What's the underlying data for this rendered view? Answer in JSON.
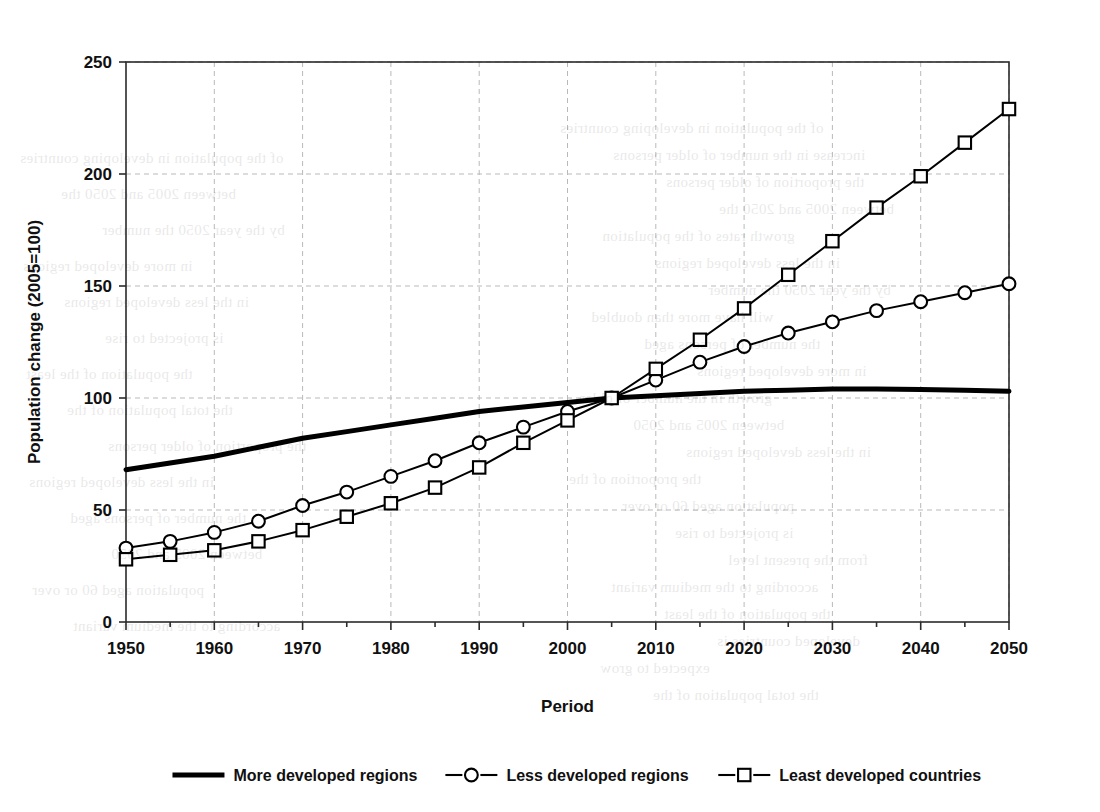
{
  "chart_data": {
    "type": "line",
    "title": "",
    "xlabel": "Period",
    "ylabel": "Population change (2005=100)",
    "xlim": [
      1950,
      2050
    ],
    "ylim": [
      0,
      250
    ],
    "ytick_values": [
      0,
      50,
      100,
      150,
      200,
      250
    ],
    "ytick_labels": [
      "0",
      "50",
      "100",
      "150",
      "200",
      "250"
    ],
    "xtick_values": [
      1950,
      1960,
      1970,
      1980,
      1990,
      2000,
      2010,
      2020,
      2030,
      2040,
      2050
    ],
    "xtick_labels": [
      "1950",
      "1960",
      "1970",
      "1980",
      "1990",
      "2000",
      "2010",
      "2020",
      "2030",
      "2040",
      "2050"
    ],
    "x_minor_interval": 5,
    "grid": "major-vertical-and-horizontal-dotted",
    "legend_position": "bottom",
    "x": [
      1950,
      1955,
      1960,
      1965,
      1970,
      1975,
      1980,
      1985,
      1990,
      1995,
      2000,
      2005,
      2010,
      2015,
      2020,
      2025,
      2030,
      2035,
      2040,
      2045,
      2050
    ],
    "series": [
      {
        "name": "More developed regions",
        "marker": "none",
        "line_width": 5,
        "color": "#000000",
        "values": [
          68,
          71,
          74,
          78,
          82,
          85,
          88,
          91,
          94,
          96,
          98,
          100,
          101,
          102,
          103,
          103.5,
          104,
          104,
          103.8,
          103.5,
          103
        ]
      },
      {
        "name": "Less developed regions",
        "marker": "circle",
        "line_width": 2,
        "color": "#000000",
        "values": [
          33,
          36,
          40,
          45,
          52,
          58,
          65,
          72,
          80,
          87,
          94,
          100,
          108,
          116,
          123,
          129,
          134,
          139,
          143,
          147,
          151
        ]
      },
      {
        "name": "Least developed countries",
        "marker": "square",
        "line_width": 2,
        "color": "#000000",
        "values": [
          28,
          30,
          32,
          36,
          41,
          47,
          53,
          60,
          69,
          80,
          90,
          100,
          113,
          126,
          140,
          155,
          170,
          185,
          199,
          214,
          229
        ]
      }
    ]
  },
  "legend": {
    "items": [
      {
        "label": "More developed regions",
        "marker": "none"
      },
      {
        "label": "Less developed regions",
        "marker": "circle"
      },
      {
        "label": "Least developed countries",
        "marker": "square"
      }
    ]
  },
  "background_text": {
    "lines": [
      "of the population in developing countries",
      "increase in the number of older persons",
      "the proportion of older persons",
      "between 2005 and 2050 the",
      "growth rates of the population",
      "in the less developed regions",
      "by the year 2050 the number",
      "will have more than doubled",
      "the number of persons aged",
      "in more developed regions",
      "growth in the number of older",
      "between 2005 and 2050",
      "in the less developed regions",
      "the proportion of the",
      "population aged 60 or over",
      "is projected to rise",
      "from the present level",
      "according to the medium variant",
      "the population of the least",
      "developed countries is",
      "expected to grow",
      "the total population of the"
    ]
  }
}
